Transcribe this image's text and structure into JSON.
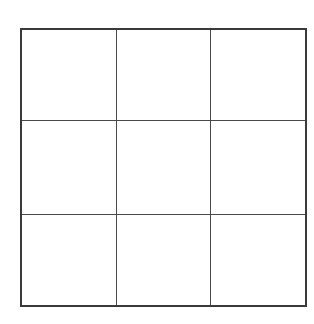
{
  "grid": {
    "rows": 3,
    "cols": 3,
    "line_color": "#4a4a4a",
    "border_color": "#3a3a3a",
    "background": "#ffffff",
    "cells": [
      "",
      "",
      "",
      "",
      "",
      "",
      "",
      "",
      ""
    ]
  }
}
